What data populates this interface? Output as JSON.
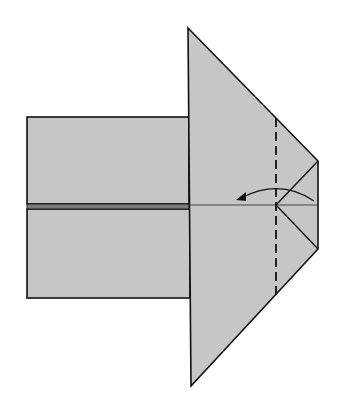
{
  "diagram": {
    "type": "origami-step",
    "colors": {
      "paper_fill": "#c6c6c6",
      "outline": "#111111",
      "center_band": "#7a7a7a",
      "background": "#ffffff"
    },
    "shapes": {
      "left_body_top": {
        "x1": 27,
        "y1": 117,
        "x2": 189,
        "y2": 203
      },
      "left_body_bottom": {
        "x1": 27,
        "y1": 209,
        "x2": 190,
        "y2": 298
      },
      "triangle_flap": {
        "points": [
          [
            188,
            28
          ],
          [
            318,
            161
          ],
          [
            318,
            249
          ],
          [
            191,
            386
          ]
        ]
      },
      "tip_creases": {
        "center": [
          276,
          205
        ],
        "top_corner": [
          318,
          161
        ],
        "bottom_corner": [
          318,
          249
        ]
      },
      "center_line": {
        "x1": 189,
        "y1": 205,
        "x2": 318,
        "y2": 205
      }
    },
    "fold_line": {
      "style": "dashed",
      "kind": "valley-fold",
      "x": 276,
      "y1": 118,
      "y2": 295
    },
    "arrow": {
      "direction": "left",
      "start": [
        314,
        201
      ],
      "control": [
        278,
        180
      ],
      "end": [
        237,
        199
      ],
      "meaning": "fold tip to the left"
    }
  }
}
